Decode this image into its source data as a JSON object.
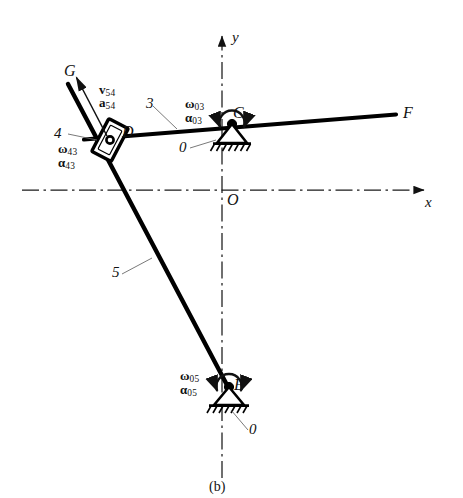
{
  "figure": {
    "caption": "(b)",
    "type": "kinematic-linkage-diagram",
    "colors": {
      "link": "#000000",
      "axis": "#1a1a1a",
      "leader": "#555555",
      "text": "#111111",
      "background": "#ffffff"
    }
  },
  "axes": {
    "x_label": "x",
    "y_label": "y",
    "origin_label": "O",
    "style": "dash-dot centerlines with solid arrowheads",
    "origin_px": {
      "x": 222,
      "y": 190
    },
    "x_axis_y_px": 190,
    "y_axis_x_px": 222
  },
  "points": [
    {
      "name": "G",
      "label": "G",
      "x": 70,
      "y": 73,
      "desc": "free end of link 5"
    },
    {
      "name": "D",
      "label": "D",
      "x": 113,
      "y": 137,
      "desc": "slider pin joint between links 3 and 5"
    },
    {
      "name": "C",
      "label": "C",
      "x": 232,
      "y": 117,
      "desc": "ground pivot of link 3"
    },
    {
      "name": "F",
      "label": "F",
      "x": 398,
      "y": 114,
      "desc": "free end of link 3"
    },
    {
      "name": "E",
      "label": "E",
      "x": 229,
      "y": 387,
      "desc": "ground pivot of link 5"
    },
    {
      "name": "O",
      "label": "O",
      "x": 231,
      "y": 197,
      "desc": "coordinate origin"
    }
  ],
  "links": [
    {
      "id": "3",
      "label": "3",
      "from": "G-side-of-D",
      "to": "F",
      "desc": "long slightly inclined bar through D and C out to F"
    },
    {
      "id": "4",
      "label": "4",
      "desc": "slider block at D riding on link 5"
    },
    {
      "id": "5",
      "label": "5",
      "from": "G",
      "to": "E",
      "desc": "bar from G through D down to ground pivot E"
    },
    {
      "id": "0a",
      "label": "0",
      "desc": "ground/frame at pivot C"
    },
    {
      "id": "0b",
      "label": "0",
      "desc": "ground/frame at pivot E"
    }
  ],
  "annotations": [
    {
      "id": "v54",
      "symbol": "v",
      "subscript": "54",
      "bold": true,
      "desc": "relative velocity of 5 w.r.t. 4 at D, directed toward G"
    },
    {
      "id": "a54",
      "symbol": "a",
      "subscript": "54",
      "bold": true,
      "desc": "relative acceleration of 5 w.r.t. 4 at D, directed toward G"
    },
    {
      "id": "w43",
      "symbol": "ω",
      "subscript": "43",
      "bold": true,
      "desc": "angular velocity of 4 relative to 3"
    },
    {
      "id": "al43",
      "symbol": "α",
      "subscript": "43",
      "bold": true,
      "desc": "angular acceleration of 4 relative to 3"
    },
    {
      "id": "w03",
      "symbol": "ω",
      "subscript": "03",
      "bold": true,
      "desc": "angular velocity of 3 relative to ground"
    },
    {
      "id": "al03",
      "symbol": "α",
      "subscript": "03",
      "bold": true,
      "desc": "angular acceleration of 3 relative to ground"
    },
    {
      "id": "w05",
      "symbol": "ω",
      "subscript": "05",
      "bold": true,
      "desc": "angular velocity of 5 relative to ground"
    },
    {
      "id": "al05",
      "symbol": "α",
      "subscript": "05",
      "bold": true,
      "desc": "angular acceleration of 5 relative to ground"
    }
  ],
  "labels": {
    "G": "G",
    "D": "D",
    "C": "C",
    "F": "F",
    "E": "E",
    "O": "O",
    "x": "x",
    "y": "y",
    "three": "3",
    "four": "4",
    "five": "5",
    "zero_c": "0",
    "zero_e": "0",
    "v": "v",
    "a": "a",
    "omega": "ω",
    "alpha": "α",
    "sub54": "54",
    "sub43": "43",
    "sub03": "03",
    "sub05": "05",
    "caption": "(b)"
  }
}
